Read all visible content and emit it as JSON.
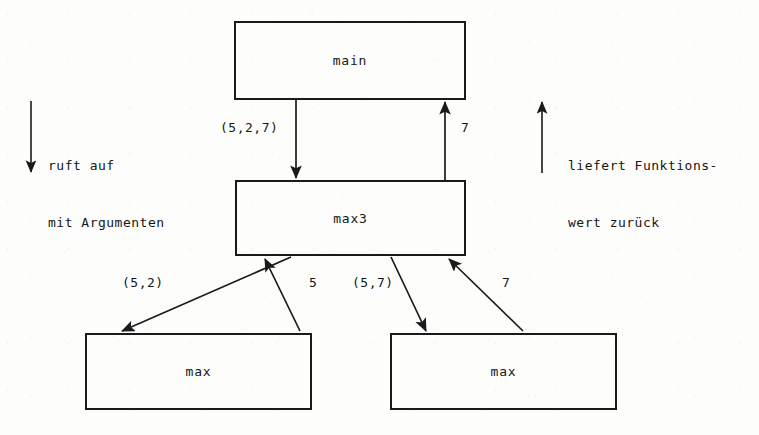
{
  "diagram": {
    "ink_color": "#1a1a1a",
    "background_color": "#fdfdfc",
    "nodes": [
      {
        "id": "main",
        "label": "main",
        "x": 234,
        "y": 21,
        "w": 232,
        "h": 79
      },
      {
        "id": "max3",
        "label": "max3",
        "x": 235,
        "y": 180,
        "w": 231,
        "h": 76
      },
      {
        "id": "max_left",
        "label": "max",
        "x": 85,
        "y": 333,
        "w": 227,
        "h": 77
      },
      {
        "id": "max_right",
        "label": "max",
        "x": 390,
        "y": 333,
        "w": 227,
        "h": 77
      }
    ],
    "edges": [
      {
        "id": "main-to-max3",
        "label": "(5,2,7)",
        "from": "main",
        "to": "max3",
        "direction": "down",
        "label_x": 220,
        "label_y": 120
      },
      {
        "id": "max3-to-main",
        "label": "7",
        "from": "max3",
        "to": "main",
        "direction": "up",
        "label_x": 461,
        "label_y": 120
      },
      {
        "id": "max3-to-maxleft",
        "label": "(5,2)",
        "from": "max3",
        "to": "max_left",
        "direction": "down",
        "label_x": 122,
        "label_y": 275
      },
      {
        "id": "maxleft-to-max3",
        "label": "5",
        "from": "max_left",
        "to": "max3",
        "direction": "up",
        "label_x": 309,
        "label_y": 275
      },
      {
        "id": "max3-to-maxright",
        "label": "(5,7)",
        "from": "max3",
        "to": "max_right",
        "direction": "down",
        "label_x": 352,
        "label_y": 275
      },
      {
        "id": "maxright-to-max3",
        "label": "7",
        "from": "max_right",
        "to": "max3",
        "direction": "up",
        "label_x": 502,
        "label_y": 275
      }
    ],
    "annotations": [
      {
        "id": "call-note",
        "line1": "ruft auf",
        "line2": "mit Argumenten",
        "arrow_direction": "down",
        "text_x": 48,
        "text_y": 118
      },
      {
        "id": "return-note",
        "line1": "liefert Funktions-",
        "line2": "wert zurück",
        "arrow_direction": "up",
        "text_x": 568,
        "text_y": 118
      }
    ]
  }
}
